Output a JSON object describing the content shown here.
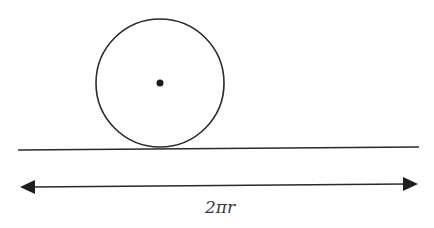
{
  "diagram": {
    "elements": {
      "circle": {
        "cx": 160,
        "cy": 83,
        "r": 64,
        "stroke": "#2a2a2a"
      },
      "center_point": {
        "cx": 160,
        "cy": 83,
        "r": 3.5,
        "fill": "#1a1a1a"
      },
      "ground_line": {
        "x1": 18,
        "y1": 150,
        "x2": 419,
        "y2": 147,
        "stroke": "#2a2a2a"
      },
      "distance_arrow": {
        "x1": 20,
        "y1": 187,
        "x2": 418,
        "y2": 184,
        "double_headed": true,
        "stroke": "#2a2a2a"
      }
    },
    "label": "2πr"
  }
}
